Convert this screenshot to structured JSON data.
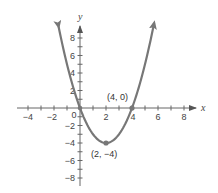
{
  "chart_data": {
    "type": "line",
    "title": "",
    "xlabel": "x",
    "ylabel": "y",
    "xlim": [
      -4.8,
      9
    ],
    "ylim": [
      -8.8,
      9.2
    ],
    "grid": false,
    "legend": null,
    "x_ticks": [
      -4,
      -3,
      -2,
      -1,
      1,
      2,
      3,
      4,
      5,
      6,
      7,
      8
    ],
    "x_tick_labels": [
      "-4",
      "-2",
      "0",
      "2",
      "4",
      "6",
      "8"
    ],
    "x_tick_label_values": [
      -4,
      -2,
      0,
      2,
      4,
      6,
      8
    ],
    "y_ticks": [
      -8,
      -7,
      -6,
      -5,
      -4,
      -3,
      -2,
      -1,
      1,
      2,
      3,
      4,
      5,
      6,
      7,
      8
    ],
    "y_tick_labels": [
      "8",
      "6",
      "4",
      "2",
      "-2",
      "-4",
      "-6",
      "-8"
    ],
    "y_tick_label_values": [
      8,
      6,
      4,
      2,
      -2,
      -4,
      -6,
      -8
    ],
    "series": [
      {
        "name": "f(x) = x^2 - 4x",
        "equation": "y = x^2 - 4x",
        "x_range": [
          -1.65,
          5.7
        ],
        "x": [
          -1.5,
          -1,
          0,
          1,
          2,
          3,
          4,
          5,
          5.5
        ],
        "values": [
          8.25,
          5,
          0,
          -3,
          -4,
          -3,
          0,
          5,
          8.25
        ],
        "color": "#777777",
        "arrows_at_ends": true
      }
    ],
    "points": [
      {
        "x": 0,
        "y": 0,
        "label": ""
      },
      {
        "x": 2,
        "y": -4,
        "label": "(2, −4)"
      },
      {
        "x": 4,
        "y": 0,
        "label": "(4, 0)"
      }
    ],
    "annotations": [
      "(4, 0)",
      "(2, −4)"
    ]
  },
  "labels": {
    "x_axis": "x",
    "y_axis": "y",
    "origin": "0",
    "vertex": "(2, −4)",
    "x_intercept": "(4, 0)",
    "xticks": [
      "−4",
      "−2",
      "2",
      "4",
      "6",
      "8"
    ],
    "yticks": [
      "8",
      "6",
      "4",
      "2",
      "−2",
      "−4",
      "−6",
      "−8"
    ]
  },
  "colors": {
    "curve": "#777777",
    "axis": "#666666",
    "text": "#444444"
  }
}
